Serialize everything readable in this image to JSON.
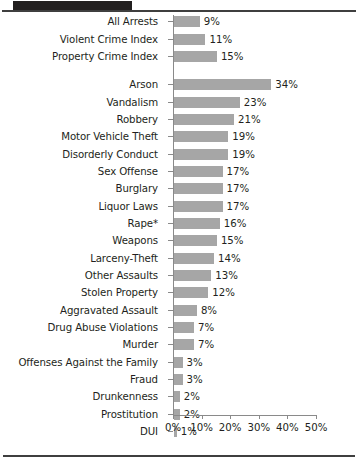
{
  "chart_data": {
    "type": "bar",
    "orientation": "horizontal",
    "title": "",
    "xlabel": "",
    "ylabel": "",
    "xlim": [
      0,
      50
    ],
    "xticks": [
      0,
      10,
      20,
      30,
      40,
      50
    ],
    "xtick_labels": [
      "0%",
      "10%",
      "20%",
      "30%",
      "40%",
      "50%"
    ],
    "grid": false,
    "legend": null,
    "bar_color": "#a6a6a6",
    "value_suffix": "%",
    "groups": [
      {
        "name": "summary",
        "categories": [
          "All Arrests",
          "Violent Crime Index",
          "Property Crime Index"
        ],
        "values": [
          9,
          11,
          15
        ],
        "value_labels": [
          "9%",
          "11%",
          "15%"
        ]
      },
      {
        "name": "offenses",
        "categories": [
          "Arson",
          "Vandalism",
          "Robbery",
          "Motor Vehicle Theft",
          "Disorderly Conduct",
          "Sex Offense",
          "Burglary",
          "Liquor Laws",
          "Rape*",
          "Weapons",
          "Larceny-Theft",
          "Other Assaults",
          "Stolen Property",
          "Aggravated Assault",
          "Drug Abuse Violations",
          "Murder",
          "Offenses Against the Family",
          "Fraud",
          "Drunkenness",
          "Prostitution",
          "DUI"
        ],
        "values": [
          34,
          23,
          21,
          19,
          19,
          17,
          17,
          17,
          16,
          15,
          14,
          13,
          12,
          8,
          7,
          7,
          3,
          3,
          2,
          2,
          1
        ],
        "value_labels": [
          "34%",
          "23%",
          "21%",
          "19%",
          "19%",
          "17%",
          "17%",
          "17%",
          "16%",
          "15%",
          "14%",
          "13%",
          "12%",
          "8%",
          "7%",
          "7%",
          "3%",
          "3%",
          "2%",
          "2%",
          "1%"
        ]
      }
    ]
  }
}
